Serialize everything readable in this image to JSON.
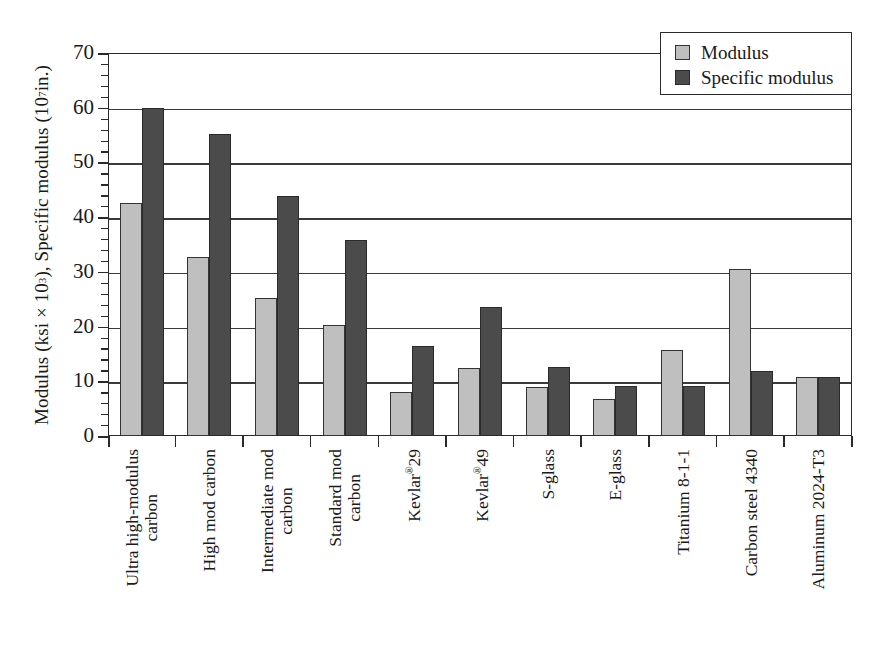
{
  "chart_data": {
    "type": "bar",
    "title": "",
    "xlabel": "",
    "ylabel": "Modulus (ksi × 10³), Specific modulus (10⁷ in.)",
    "ylabel_parts": {
      "pre": "Modulus (ksi × 10",
      "sup1": "3",
      "mid": "), Specific modulus (10",
      "sup2": "7",
      "post": " in.)"
    },
    "ylim": [
      0,
      70
    ],
    "yticks": [
      0,
      10,
      20,
      30,
      40,
      50,
      60,
      70
    ],
    "ytick_labels": [
      "0",
      "10",
      "20",
      "30",
      "40",
      "50",
      "60",
      "70"
    ],
    "minor_tick_step": 2,
    "grid": true,
    "legend_position": "top-right",
    "categories": [
      "Ultra high-modulus carbon",
      "High mod carbon",
      "Intermediate mod carbon",
      "Standard mod carbon",
      "Kevlar®29",
      "Kevlar®49",
      "S-glass",
      "E-glass",
      "Titanium 8-1-1",
      "Carbon steel 4340",
      "Aluminum 2024-T3"
    ],
    "category_lines": [
      [
        "Ultra high-modulus",
        "carbon"
      ],
      [
        "High mod carbon"
      ],
      [
        "Intermediate mod",
        "carbon"
      ],
      [
        "Standard mod",
        "carbon"
      ],
      [
        "Kevlar®29"
      ],
      [
        "Kevlar®49"
      ],
      [
        "S-glass"
      ],
      [
        "E-glass"
      ],
      [
        "Titanium 8-1-1"
      ],
      [
        "Carbon steel 4340"
      ],
      [
        "Aluminum 2024-T3"
      ]
    ],
    "series": [
      {
        "name": "Modulus",
        "color": "#bfbfbf",
        "values": [
          42.6,
          32.7,
          25.3,
          20.3,
          8.0,
          12.5,
          9.0,
          6.7,
          15.8,
          30.6,
          10.7
        ]
      },
      {
        "name": "Specific modulus",
        "color": "#4b4b4b",
        "values": [
          60.0,
          55.2,
          43.9,
          35.9,
          16.4,
          23.6,
          12.7,
          9.2,
          9.2,
          11.8,
          10.7
        ]
      }
    ]
  },
  "legend": {
    "items": [
      {
        "label": "Modulus",
        "swatch": "modulus"
      },
      {
        "label": "Specific modulus",
        "swatch": "specific"
      }
    ]
  }
}
